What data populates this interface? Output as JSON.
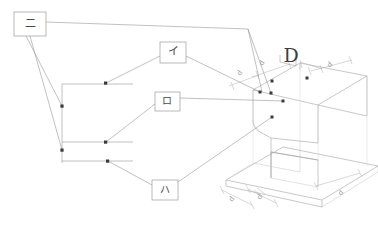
{
  "drawing": {
    "title": "Isometric part drawing with lettered callouts",
    "background_color": "#ffffff",
    "line_color": "#9a9a9a",
    "light_line_color": "#c2c2c2",
    "faint_line_color": "#d4d4d4",
    "marker_color": "#3a3a3a",
    "text_color": "#4a4a4a",
    "dim_text_color": "#9b9b9b",
    "width": 378,
    "height": 229
  },
  "callouts": [
    {
      "id": "callout-ni",
      "label": "二",
      "font_size": 11,
      "box": {
        "x": 14,
        "y": 12,
        "w": 32,
        "h": 24
      },
      "text_x": 30,
      "text_y": 24
    },
    {
      "id": "callout-i",
      "label": "イ",
      "font_size": 11,
      "box": {
        "x": 160,
        "y": 42,
        "w": 26,
        "h": 21
      },
      "text_x": 173,
      "text_y": 52
    },
    {
      "id": "callout-ro",
      "label": "ロ",
      "font_size": 10,
      "box": {
        "x": 155,
        "y": 92,
        "w": 25,
        "h": 19
      },
      "text_x": 167,
      "text_y": 101
    },
    {
      "id": "callout-ha",
      "label": "ハ",
      "font_size": 10,
      "box": {
        "x": 152,
        "y": 180,
        "w": 26,
        "h": 20
      },
      "text_x": 165,
      "text_y": 190
    }
  ],
  "section_label": {
    "id": "section-letter-d",
    "label": "D",
    "x": 291,
    "y": 57
  },
  "dimension_labels": [
    {
      "id": "dim-top-a",
      "label": "d",
      "x": 240,
      "y": 73,
      "rotate": -52
    },
    {
      "id": "dim-top-b",
      "label": "d",
      "x": 262,
      "y": 63,
      "rotate": -55
    },
    {
      "id": "dim-top-c",
      "label": "d",
      "x": 330,
      "y": 65,
      "rotate": -40
    },
    {
      "id": "dim-base-a",
      "label": "d",
      "x": 232,
      "y": 199,
      "rotate": -52
    },
    {
      "id": "dim-base-b",
      "label": "d",
      "x": 260,
      "y": 197,
      "rotate": -52
    },
    {
      "id": "dim-base-c",
      "label": "d",
      "x": 341,
      "y": 193,
      "rotate": -45
    }
  ],
  "leader_targets": [
    {
      "id": "target-i",
      "x": 106,
      "y": 83
    },
    {
      "id": "target-ro",
      "x": 106,
      "y": 142
    },
    {
      "id": "target-ha",
      "x": 108,
      "y": 161
    },
    {
      "id": "target-ni-upper",
      "x": 62,
      "y": 106
    },
    {
      "id": "target-ni-lower",
      "x": 61,
      "y": 150
    },
    {
      "id": "target-part-1",
      "x": 260,
      "y": 92
    },
    {
      "id": "target-part-2",
      "x": 272,
      "y": 81
    },
    {
      "id": "target-part-3",
      "x": 283,
      "y": 101
    },
    {
      "id": "target-part-4",
      "x": 272,
      "y": 117
    },
    {
      "id": "target-part-5",
      "x": 307,
      "y": 78
    },
    {
      "id": "target-part-6",
      "x": 271,
      "y": 93
    }
  ],
  "geometry_notes": {
    "part_type": "isometric-block-with-base-plate",
    "features": "chamfered vertical corner, stepped base flange, hidden construction lines"
  }
}
